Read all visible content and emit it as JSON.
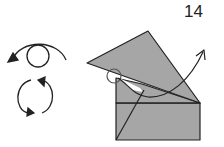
{
  "diagram": {
    "step_number": "14",
    "symbols": [
      "turn-over-icon",
      "rotate-icon"
    ],
    "colors": {
      "paper": "#a6a6a6",
      "line": "#222222"
    }
  }
}
